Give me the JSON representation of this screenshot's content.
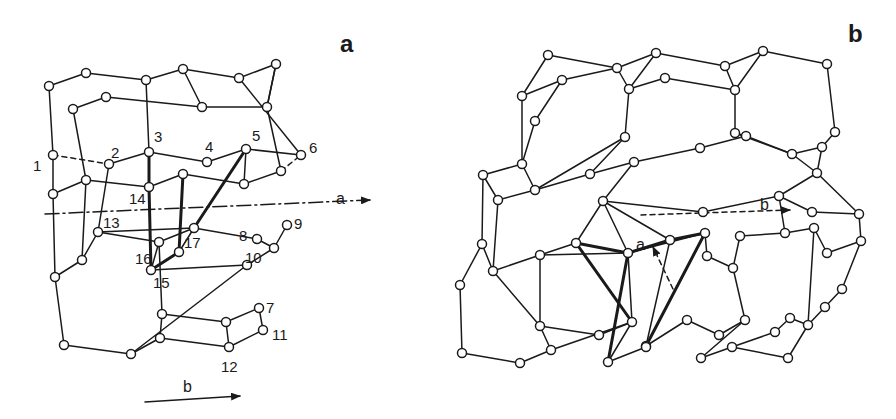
{
  "panels": [
    {
      "id": "a",
      "label": "a",
      "label_pos": [
        340,
        52
      ],
      "axes": [
        {
          "name": "a",
          "from": [
            45,
            214
          ],
          "to": [
            370,
            200
          ],
          "style": "dashdot",
          "label": "a",
          "label_pos": [
            336,
            204
          ]
        },
        {
          "name": "b",
          "from": [
            145,
            402
          ],
          "to": [
            240,
            396
          ],
          "style": "solid",
          "label": "b",
          "label_pos": [
            183,
            392
          ]
        }
      ],
      "nodes": [
        [
          49,
          86
        ],
        [
          86,
          73
        ],
        [
          146,
          80
        ],
        [
          183,
          69
        ],
        [
          239,
          78
        ],
        [
          276,
          64
        ],
        [
          73,
          109
        ],
        [
          106,
          97
        ],
        [
          202,
          107
        ],
        [
          267,
          107
        ],
        [
          53,
          155
        ],
        [
          109,
          164
        ],
        [
          149,
          152
        ],
        [
          207,
          162
        ],
        [
          246,
          149
        ],
        [
          301,
          155
        ],
        [
          53,
          194
        ],
        [
          86,
          180
        ],
        [
          149,
          187
        ],
        [
          183,
          174
        ],
        [
          244,
          184
        ],
        [
          281,
          171
        ],
        [
          98,
          232
        ],
        [
          159,
          242
        ],
        [
          194,
          228
        ],
        [
          257,
          239
        ],
        [
          287,
          225
        ],
        [
          274,
          248
        ],
        [
          82,
          260
        ],
        [
          55,
          277
        ],
        [
          151,
          270
        ],
        [
          179,
          252
        ],
        [
          247,
          265
        ],
        [
          162,
          314
        ],
        [
          226,
          322
        ],
        [
          259,
          308
        ],
        [
          263,
          330
        ],
        [
          160,
          338
        ],
        [
          229,
          347
        ],
        [
          64,
          345
        ],
        [
          131,
          354
        ]
      ],
      "edges": [
        [
          0,
          1
        ],
        [
          1,
          2
        ],
        [
          2,
          3
        ],
        [
          3,
          4
        ],
        [
          4,
          5
        ],
        [
          5,
          9
        ],
        [
          9,
          8
        ],
        [
          8,
          7
        ],
        [
          7,
          6
        ],
        [
          0,
          10
        ],
        [
          6,
          17
        ],
        [
          2,
          12
        ],
        [
          3,
          8
        ],
        [
          4,
          15
        ],
        [
          5,
          9
        ],
        [
          10,
          11
        ],
        [
          11,
          12
        ],
        [
          12,
          13
        ],
        [
          13,
          14
        ],
        [
          14,
          15
        ],
        [
          10,
          16
        ],
        [
          16,
          17
        ],
        [
          17,
          18
        ],
        [
          18,
          19
        ],
        [
          19,
          20
        ],
        [
          20,
          21
        ],
        [
          12,
          18
        ],
        [
          14,
          20
        ],
        [
          21,
          15
        ],
        [
          9,
          21
        ],
        [
          17,
          28
        ],
        [
          28,
          22
        ],
        [
          22,
          24
        ],
        [
          16,
          29
        ],
        [
          29,
          28
        ],
        [
          23,
          24
        ],
        [
          24,
          25
        ],
        [
          25,
          27
        ],
        [
          27,
          26
        ],
        [
          22,
          23
        ],
        [
          23,
          30
        ],
        [
          30,
          32
        ],
        [
          32,
          27
        ],
        [
          23,
          33
        ],
        [
          33,
          34
        ],
        [
          34,
          35
        ],
        [
          35,
          36
        ],
        [
          36,
          38
        ],
        [
          38,
          37
        ],
        [
          37,
          33
        ],
        [
          29,
          39
        ],
        [
          39,
          40
        ],
        [
          40,
          37
        ],
        [
          40,
          32
        ],
        [
          38,
          34
        ],
        [
          11,
          22
        ],
        [
          24,
          31
        ]
      ],
      "bold_edges": [
        [
          12,
          18
        ],
        [
          18,
          30
        ],
        [
          30,
          31
        ],
        [
          31,
          19
        ],
        [
          19,
          19
        ],
        [
          14,
          24
        ]
      ],
      "dashed_edges": [
        [
          10,
          11
        ],
        [
          16,
          22
        ],
        [
          15,
          21
        ]
      ],
      "numbered": [
        {
          "n": "1",
          "node": 10,
          "dx": -20,
          "dy": 16
        },
        {
          "n": "2",
          "node": 11,
          "dx": 2,
          "dy": -6
        },
        {
          "n": "3",
          "node": 12,
          "dx": 5,
          "dy": -10
        },
        {
          "n": "4",
          "node": 13,
          "dx": -2,
          "dy": -10
        },
        {
          "n": "5",
          "node": 14,
          "dx": 6,
          "dy": -8
        },
        {
          "n": "6",
          "node": 15,
          "dx": 8,
          "dy": -2
        },
        {
          "n": "7",
          "node": 35,
          "dx": 7,
          "dy": 5
        },
        {
          "n": "8",
          "node": 25,
          "dx": -18,
          "dy": 2
        },
        {
          "n": "9",
          "node": 26,
          "dx": 7,
          "dy": 4
        },
        {
          "n": "10",
          "node": 27,
          "dx": -29,
          "dy": 15
        },
        {
          "n": "11",
          "node": 36,
          "dx": 9,
          "dy": 10
        },
        {
          "n": "12",
          "node": 38,
          "dx": -8,
          "dy": 25
        },
        {
          "n": "13",
          "node": 22,
          "dx": 5,
          "dy": -4
        },
        {
          "n": "14",
          "node": 18,
          "dx": -20,
          "dy": 17
        },
        {
          "n": "15",
          "node": 30,
          "dx": 2,
          "dy": 18
        },
        {
          "n": "16",
          "node": 23,
          "dx": -24,
          "dy": 22
        },
        {
          "n": "17",
          "node": 31,
          "dx": 5,
          "dy": -4
        }
      ]
    },
    {
      "id": "b",
      "label": "b",
      "label_pos": [
        848,
        42
      ],
      "axes": [
        {
          "name": "a",
          "from": [
            673,
            289
          ],
          "to": [
            653,
            247
          ],
          "style": "dash",
          "label": "a",
          "label_pos": [
            636,
            250
          ]
        },
        {
          "name": "b",
          "from": [
            641,
            215
          ],
          "to": [
            790,
            210
          ],
          "style": "dash",
          "label": "b",
          "label_pos": [
            760,
            210
          ]
        }
      ],
      "nodes": [
        [
          548,
          55
        ],
        [
          617,
          68
        ],
        [
          656,
          53
        ],
        [
          725,
          66
        ],
        [
          763,
          51
        ],
        [
          827,
          64
        ],
        [
          522,
          96
        ],
        [
          562,
          80
        ],
        [
          629,
          89
        ],
        [
          665,
          78
        ],
        [
          735,
          90
        ],
        [
          535,
          121
        ],
        [
          625,
          137
        ],
        [
          735,
          133
        ],
        [
          835,
          132
        ],
        [
          522,
          164
        ],
        [
          535,
          190
        ],
        [
          590,
          174
        ],
        [
          634,
          162
        ],
        [
          700,
          148
        ],
        [
          746,
          136
        ],
        [
          792,
          154
        ],
        [
          822,
          147
        ],
        [
          817,
          173
        ],
        [
          483,
          175
        ],
        [
          498,
          200
        ],
        [
          603,
          201
        ],
        [
          703,
          212
        ],
        [
          779,
          196
        ],
        [
          812,
          212
        ],
        [
          859,
          214
        ],
        [
          482,
          244
        ],
        [
          493,
          271
        ],
        [
          540,
          255
        ],
        [
          576,
          243
        ],
        [
          628,
          253
        ],
        [
          670,
          240
        ],
        [
          705,
          233
        ],
        [
          707,
          256
        ],
        [
          733,
          268
        ],
        [
          740,
          236
        ],
        [
          785,
          233
        ],
        [
          814,
          228
        ],
        [
          827,
          253
        ],
        [
          861,
          241
        ],
        [
          460,
          285
        ],
        [
          540,
          326
        ],
        [
          599,
          335
        ],
        [
          632,
          322
        ],
        [
          646,
          346
        ],
        [
          687,
          320
        ],
        [
          719,
          335
        ],
        [
          745,
          320
        ],
        [
          775,
          332
        ],
        [
          790,
          318
        ],
        [
          808,
          325
        ],
        [
          825,
          307
        ],
        [
          842,
          289
        ],
        [
          462,
          353
        ],
        [
          520,
          363
        ],
        [
          551,
          350
        ],
        [
          608,
          362
        ],
        [
          646,
          347
        ],
        [
          701,
          358
        ],
        [
          732,
          347
        ],
        [
          788,
          358
        ]
      ],
      "edges": [
        [
          0,
          1
        ],
        [
          1,
          2
        ],
        [
          2,
          3
        ],
        [
          3,
          4
        ],
        [
          4,
          5
        ],
        [
          5,
          14
        ],
        [
          14,
          22
        ],
        [
          0,
          6
        ],
        [
          6,
          7
        ],
        [
          7,
          1
        ],
        [
          7,
          11
        ],
        [
          6,
          15
        ],
        [
          11,
          15
        ],
        [
          1,
          8
        ],
        [
          2,
          8
        ],
        [
          8,
          9
        ],
        [
          9,
          10
        ],
        [
          10,
          3
        ],
        [
          4,
          10
        ],
        [
          10,
          13
        ],
        [
          8,
          12
        ],
        [
          12,
          17
        ],
        [
          12,
          16
        ],
        [
          13,
          21
        ],
        [
          13,
          20
        ],
        [
          15,
          24
        ],
        [
          15,
          16
        ],
        [
          16,
          25
        ],
        [
          24,
          25
        ],
        [
          16,
          17
        ],
        [
          17,
          18
        ],
        [
          18,
          19
        ],
        [
          19,
          20
        ],
        [
          20,
          21
        ],
        [
          21,
          22
        ],
        [
          22,
          23
        ],
        [
          21,
          23
        ],
        [
          18,
          26
        ],
        [
          26,
          27
        ],
        [
          27,
          28
        ],
        [
          28,
          23
        ],
        [
          28,
          29
        ],
        [
          29,
          30
        ],
        [
          23,
          30
        ],
        [
          24,
          31
        ],
        [
          25,
          32
        ],
        [
          31,
          32
        ],
        [
          32,
          33
        ],
        [
          33,
          34
        ],
        [
          34,
          26
        ],
        [
          33,
          35
        ],
        [
          26,
          36
        ],
        [
          35,
          37
        ],
        [
          36,
          37
        ],
        [
          37,
          38
        ],
        [
          38,
          39
        ],
        [
          39,
          40
        ],
        [
          40,
          41
        ],
        [
          41,
          28
        ],
        [
          41,
          42
        ],
        [
          42,
          43
        ],
        [
          43,
          44
        ],
        [
          44,
          30
        ],
        [
          31,
          45
        ],
        [
          32,
          46
        ],
        [
          45,
          58
        ],
        [
          58,
          59
        ],
        [
          59,
          60
        ],
        [
          60,
          46
        ],
        [
          46,
          47
        ],
        [
          47,
          48
        ],
        [
          48,
          60
        ],
        [
          48,
          61
        ],
        [
          61,
          62
        ],
        [
          62,
          49
        ],
        [
          49,
          50
        ],
        [
          50,
          51
        ],
        [
          51,
          52
        ],
        [
          52,
          63
        ],
        [
          63,
          64
        ],
        [
          64,
          53
        ],
        [
          53,
          54
        ],
        [
          54,
          55
        ],
        [
          55,
          56
        ],
        [
          56,
          57
        ],
        [
          57,
          44
        ],
        [
          55,
          65
        ],
        [
          65,
          64
        ],
        [
          35,
          48
        ],
        [
          36,
          49
        ],
        [
          39,
          52
        ],
        [
          42,
          55
        ],
        [
          26,
          35
        ],
        [
          33,
          46
        ]
      ],
      "bold_edges": [
        [
          34,
          35
        ],
        [
          35,
          36
        ],
        [
          35,
          61
        ],
        [
          36,
          37
        ],
        [
          37,
          49
        ],
        [
          34,
          48
        ]
      ],
      "dashed_edges": []
    }
  ]
}
